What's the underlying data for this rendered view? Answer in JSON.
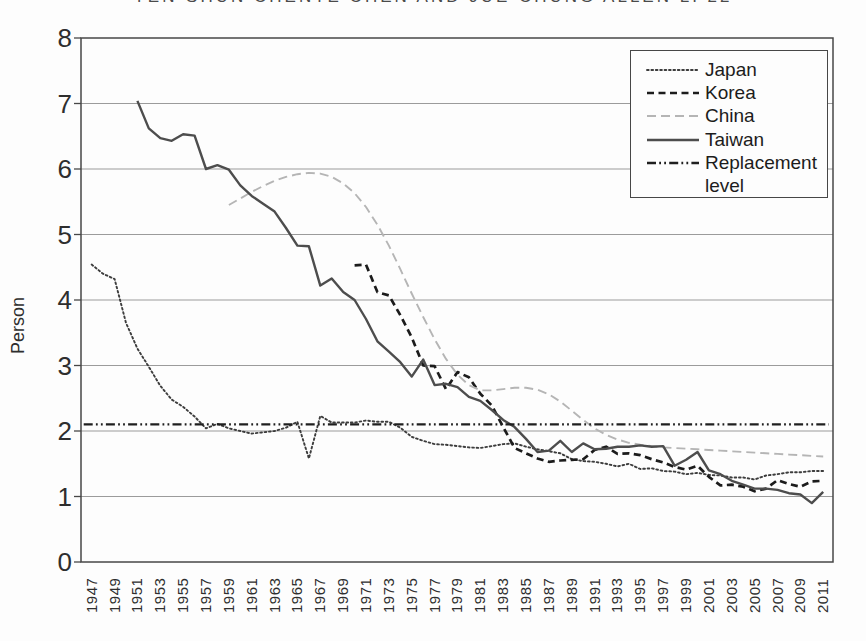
{
  "header": {
    "text": "YEN-SHUN CHENTE CHEN AND JUE-CHUNG ALLEN LI 22"
  },
  "chart_data": {
    "type": "line",
    "title": "",
    "xlabel": "",
    "ylabel": "Person",
    "ylim": [
      0,
      8
    ],
    "yticks": [
      0,
      1,
      2,
      3,
      4,
      5,
      6,
      7,
      8
    ],
    "x_range": [
      1946,
      2012
    ],
    "x_tick_years": [
      1947,
      1949,
      1951,
      1953,
      1955,
      1957,
      1959,
      1961,
      1963,
      1965,
      1967,
      1969,
      1971,
      1973,
      1975,
      1977,
      1979,
      1981,
      1983,
      1985,
      1987,
      1989,
      1991,
      1993,
      1995,
      1997,
      1999,
      2001,
      2003,
      2005,
      2007,
      2009,
      2011
    ],
    "grid": "horizontal",
    "legend": {
      "position": "top-right",
      "entries": [
        "Japan",
        "Korea",
        "China",
        "Taiwan",
        "Replacement level"
      ]
    },
    "series": [
      {
        "name": "Japan",
        "line_style": "dotted",
        "color": "#3d3d3d",
        "start_year": 1947,
        "values": [
          4.54,
          4.4,
          4.32,
          3.65,
          3.26,
          2.98,
          2.69,
          2.48,
          2.37,
          2.22,
          2.04,
          2.11,
          2.04,
          2.0,
          1.96,
          1.98,
          2.0,
          2.05,
          2.14,
          1.58,
          2.23,
          2.13,
          2.13,
          2.13,
          2.16,
          2.14,
          2.14,
          2.05,
          1.91,
          1.85,
          1.8,
          1.79,
          1.77,
          1.75,
          1.74,
          1.77,
          1.8,
          1.81,
          1.76,
          1.72,
          1.69,
          1.66,
          1.57,
          1.54,
          1.53,
          1.5,
          1.46,
          1.5,
          1.42,
          1.43,
          1.39,
          1.38,
          1.34,
          1.36,
          1.33,
          1.32,
          1.29,
          1.29,
          1.26,
          1.32,
          1.34,
          1.37,
          1.37,
          1.39,
          1.39
        ]
      },
      {
        "name": "Korea",
        "line_style": "dashed",
        "color": "#1c1c1c",
        "start_year": 1970,
        "values": [
          4.53,
          4.54,
          4.12,
          4.07,
          3.77,
          3.43,
          3.0,
          2.99,
          2.64,
          2.9,
          2.82,
          2.57,
          2.39,
          2.06,
          1.74,
          1.66,
          1.58,
          1.53,
          1.55,
          1.56,
          1.57,
          1.71,
          1.76,
          1.65,
          1.66,
          1.63,
          1.57,
          1.52,
          1.45,
          1.41,
          1.47,
          1.3,
          1.17,
          1.18,
          1.15,
          1.08,
          1.12,
          1.25,
          1.19,
          1.15,
          1.23,
          1.24
        ]
      },
      {
        "name": "China",
        "line_style": "dashed-light",
        "color": "#b5b5b5",
        "start_year": 1959,
        "values": [
          5.45,
          5.55,
          5.65,
          5.74,
          5.82,
          5.88,
          5.92,
          5.94,
          5.93,
          5.88,
          5.78,
          5.63,
          5.42,
          5.15,
          4.83,
          4.47,
          4.1,
          3.74,
          3.4,
          3.1,
          2.86,
          2.7,
          2.62,
          2.62,
          2.64,
          2.66,
          2.66,
          2.63,
          2.56,
          2.45,
          2.31,
          2.17,
          2.04,
          1.94,
          1.87,
          1.82,
          1.79,
          1.77,
          1.75,
          1.74,
          1.73,
          1.72,
          1.71,
          1.7,
          1.69,
          1.68,
          1.67,
          1.66,
          1.65,
          1.64,
          1.63,
          1.62,
          1.61
        ]
      },
      {
        "name": "Taiwan",
        "line_style": "solid",
        "color": "#4d4d4d",
        "start_year": 1951,
        "values": [
          7.04,
          6.62,
          6.47,
          6.43,
          6.53,
          6.51,
          6.0,
          6.06,
          5.99,
          5.75,
          5.59,
          5.47,
          5.35,
          5.1,
          4.83,
          4.82,
          4.22,
          4.33,
          4.12,
          4.0,
          3.71,
          3.37,
          3.21,
          3.05,
          2.83,
          3.09,
          2.7,
          2.72,
          2.67,
          2.52,
          2.46,
          2.32,
          2.17,
          2.06,
          1.88,
          1.68,
          1.7,
          1.85,
          1.68,
          1.81,
          1.72,
          1.73,
          1.76,
          1.76,
          1.78,
          1.76,
          1.77,
          1.47,
          1.56,
          1.68,
          1.4,
          1.34,
          1.24,
          1.18,
          1.12,
          1.12,
          1.1,
          1.05,
          1.03,
          0.9,
          1.07
        ]
      },
      {
        "name": "Replacement level",
        "line_style": "dashdotdot",
        "color": "#1f1f1f",
        "start_year": 1946.3,
        "end_year": 2011.5,
        "values": [
          2.1,
          2.1
        ]
      }
    ]
  }
}
